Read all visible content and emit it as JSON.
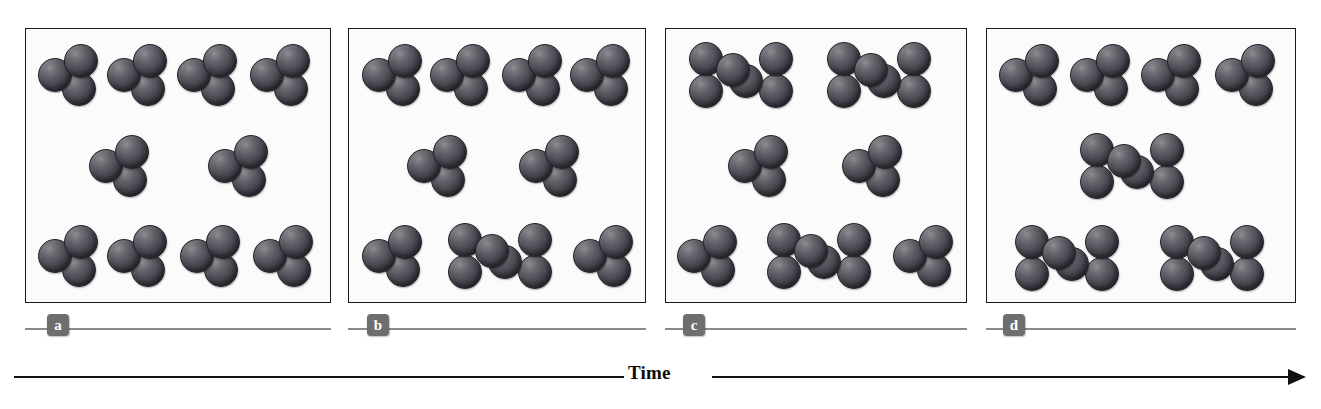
{
  "figure": {
    "caption_axis_label": "Time",
    "background_color": "#ffffff",
    "panel_background_color": "#fbfbfc",
    "panel_border_color": "#1a1a1a",
    "sphere_color": "#4b4b54",
    "label_chip_color": "#6e6e6e",
    "label_chip_text_color": "#ffffff",
    "rule_color": "#8a8a8a",
    "arrow_color": "#111111"
  },
  "panels": [
    {
      "label": "a",
      "trimer_count": 10,
      "dimer_count": 0,
      "molecules": [
        {
          "type": "trimer",
          "x": 14,
          "y": 17
        },
        {
          "type": "trimer",
          "x": 37,
          "y": 17
        },
        {
          "type": "trimer",
          "x": 60,
          "y": 17
        },
        {
          "type": "trimer",
          "x": 84,
          "y": 17
        },
        {
          "type": "trimer",
          "x": 31,
          "y": 50
        },
        {
          "type": "trimer",
          "x": 70,
          "y": 50
        },
        {
          "type": "trimer",
          "x": 14,
          "y": 83
        },
        {
          "type": "trimer",
          "x": 37,
          "y": 83
        },
        {
          "type": "trimer",
          "x": 61,
          "y": 83
        },
        {
          "type": "trimer",
          "x": 85,
          "y": 83
        }
      ]
    },
    {
      "label": "b",
      "trimer_count": 8,
      "dimer_count": 1,
      "molecules": [
        {
          "type": "trimer",
          "x": 15,
          "y": 17
        },
        {
          "type": "trimer",
          "x": 38,
          "y": 17
        },
        {
          "type": "trimer",
          "x": 62,
          "y": 17
        },
        {
          "type": "trimer",
          "x": 85,
          "y": 17
        },
        {
          "type": "trimer",
          "x": 30,
          "y": 50
        },
        {
          "type": "trimer",
          "x": 68,
          "y": 50
        },
        {
          "type": "trimer",
          "x": 15,
          "y": 83
        },
        {
          "type": "dimer",
          "x": 51,
          "y": 83
        },
        {
          "type": "trimer",
          "x": 86,
          "y": 83
        }
      ]
    },
    {
      "label": "c",
      "trimer_count": 4,
      "dimer_count": 3,
      "molecules": [
        {
          "type": "dimer",
          "x": 25,
          "y": 17
        },
        {
          "type": "dimer",
          "x": 71,
          "y": 17
        },
        {
          "type": "trimer",
          "x": 31,
          "y": 50
        },
        {
          "type": "trimer",
          "x": 69,
          "y": 50
        },
        {
          "type": "trimer",
          "x": 14,
          "y": 83
        },
        {
          "type": "dimer",
          "x": 51,
          "y": 83
        },
        {
          "type": "trimer",
          "x": 86,
          "y": 83
        }
      ]
    },
    {
      "label": "d",
      "trimer_count": 4,
      "dimer_count": 3,
      "molecules": [
        {
          "type": "trimer",
          "x": 14,
          "y": 17
        },
        {
          "type": "trimer",
          "x": 37,
          "y": 17
        },
        {
          "type": "trimer",
          "x": 60,
          "y": 17
        },
        {
          "type": "trimer",
          "x": 84,
          "y": 17
        },
        {
          "type": "dimer",
          "x": 47,
          "y": 50
        },
        {
          "type": "dimer",
          "x": 26,
          "y": 84
        },
        {
          "type": "dimer",
          "x": 73,
          "y": 84
        }
      ]
    }
  ],
  "panel_geometry": [
    {
      "left": 25,
      "width": 306
    },
    {
      "left": 348,
      "width": 298
    },
    {
      "left": 665,
      "width": 302
    },
    {
      "left": 986,
      "width": 310
    }
  ],
  "label_geometry": [
    {
      "left": 25,
      "width": 306,
      "chip_offset": 22
    },
    {
      "left": 348,
      "width": 298,
      "chip_offset": 19
    },
    {
      "left": 665,
      "width": 302,
      "chip_offset": 18
    },
    {
      "left": 986,
      "width": 310,
      "chip_offset": 17
    }
  ],
  "time_axis": {
    "label": "Time",
    "label_left": 628,
    "left_line_width": 610,
    "right_line_left": 712,
    "right_line_width": 578,
    "arrowhead_left": 1288
  }
}
